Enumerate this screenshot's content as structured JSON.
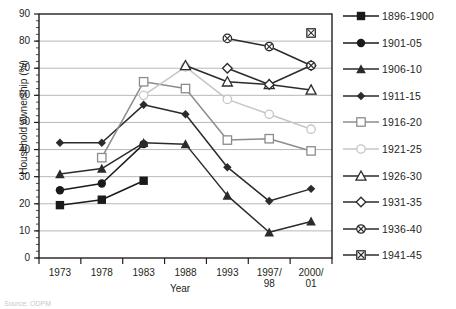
{
  "chart_data": {
    "type": "line",
    "title": "",
    "xlabel": "Year",
    "ylabel": "Household ownership (%)",
    "categories": [
      "1973",
      "1978",
      "1983",
      "1988",
      "1993",
      "1997/\n98",
      "2000/\n01"
    ],
    "x_tick_labels": [
      "1973",
      "1978",
      "1983",
      "1988",
      "1993",
      "1997/ 98",
      "2000/ 01"
    ],
    "y_tick_labels": [
      "0",
      "10",
      "20",
      "30",
      "40",
      "50",
      "60",
      "70",
      "80",
      "90"
    ],
    "ylim": [
      0,
      90
    ],
    "ytick_step": 10,
    "grid": "horizontal",
    "legend_position": "right",
    "series": [
      {
        "name": "1896-1900",
        "marker": "filled-square",
        "color": "#1a1a1a",
        "values": [
          19.5,
          21.5,
          28.5,
          null,
          null,
          null,
          null
        ]
      },
      {
        "name": "1901-05",
        "marker": "filled-circle",
        "color": "#1a1a1a",
        "values": [
          25.0,
          27.5,
          42.0,
          null,
          null,
          null,
          null
        ]
      },
      {
        "name": "1906-10",
        "marker": "filled-triangle",
        "color": "#2b2b2b",
        "values": [
          31.0,
          33.0,
          42.5,
          42.0,
          23.0,
          9.5,
          13.5
        ]
      },
      {
        "name": "1911-15",
        "marker": "filled-diamond",
        "color": "#2b2b2b",
        "values": [
          42.5,
          42.5,
          56.5,
          53.0,
          33.5,
          21.0,
          25.5
        ]
      },
      {
        "name": "1916-20",
        "marker": "open-square",
        "color": "#8c8c8c",
        "values": [
          null,
          37.0,
          65.0,
          62.5,
          43.5,
          44.0,
          39.5
        ]
      },
      {
        "name": "1921-25",
        "marker": "open-circle",
        "color": "#c6c6c6",
        "values": [
          null,
          null,
          60.0,
          70.5,
          58.5,
          53.0,
          47.5
        ]
      },
      {
        "name": "1926-30",
        "marker": "open-triangle",
        "color": "#2b2b2b",
        "values": [
          null,
          null,
          null,
          71.0,
          65.0,
          64.0,
          62.0
        ]
      },
      {
        "name": "1931-35",
        "marker": "open-diamond",
        "color": "#2b2b2b",
        "values": [
          null,
          null,
          null,
          null,
          70.0,
          64.0,
          71.0
        ]
      },
      {
        "name": "1936-40",
        "marker": "crossed-circle",
        "color": "#2b2b2b",
        "values": [
          null,
          null,
          null,
          null,
          81.0,
          78.0,
          71.0
        ]
      },
      {
        "name": "1941-45",
        "marker": "crossed-square",
        "color": "#2b2b2b",
        "values": [
          null,
          null,
          null,
          null,
          null,
          null,
          83.0
        ]
      }
    ]
  },
  "footer": {
    "source_note": "Source: ODPM"
  }
}
